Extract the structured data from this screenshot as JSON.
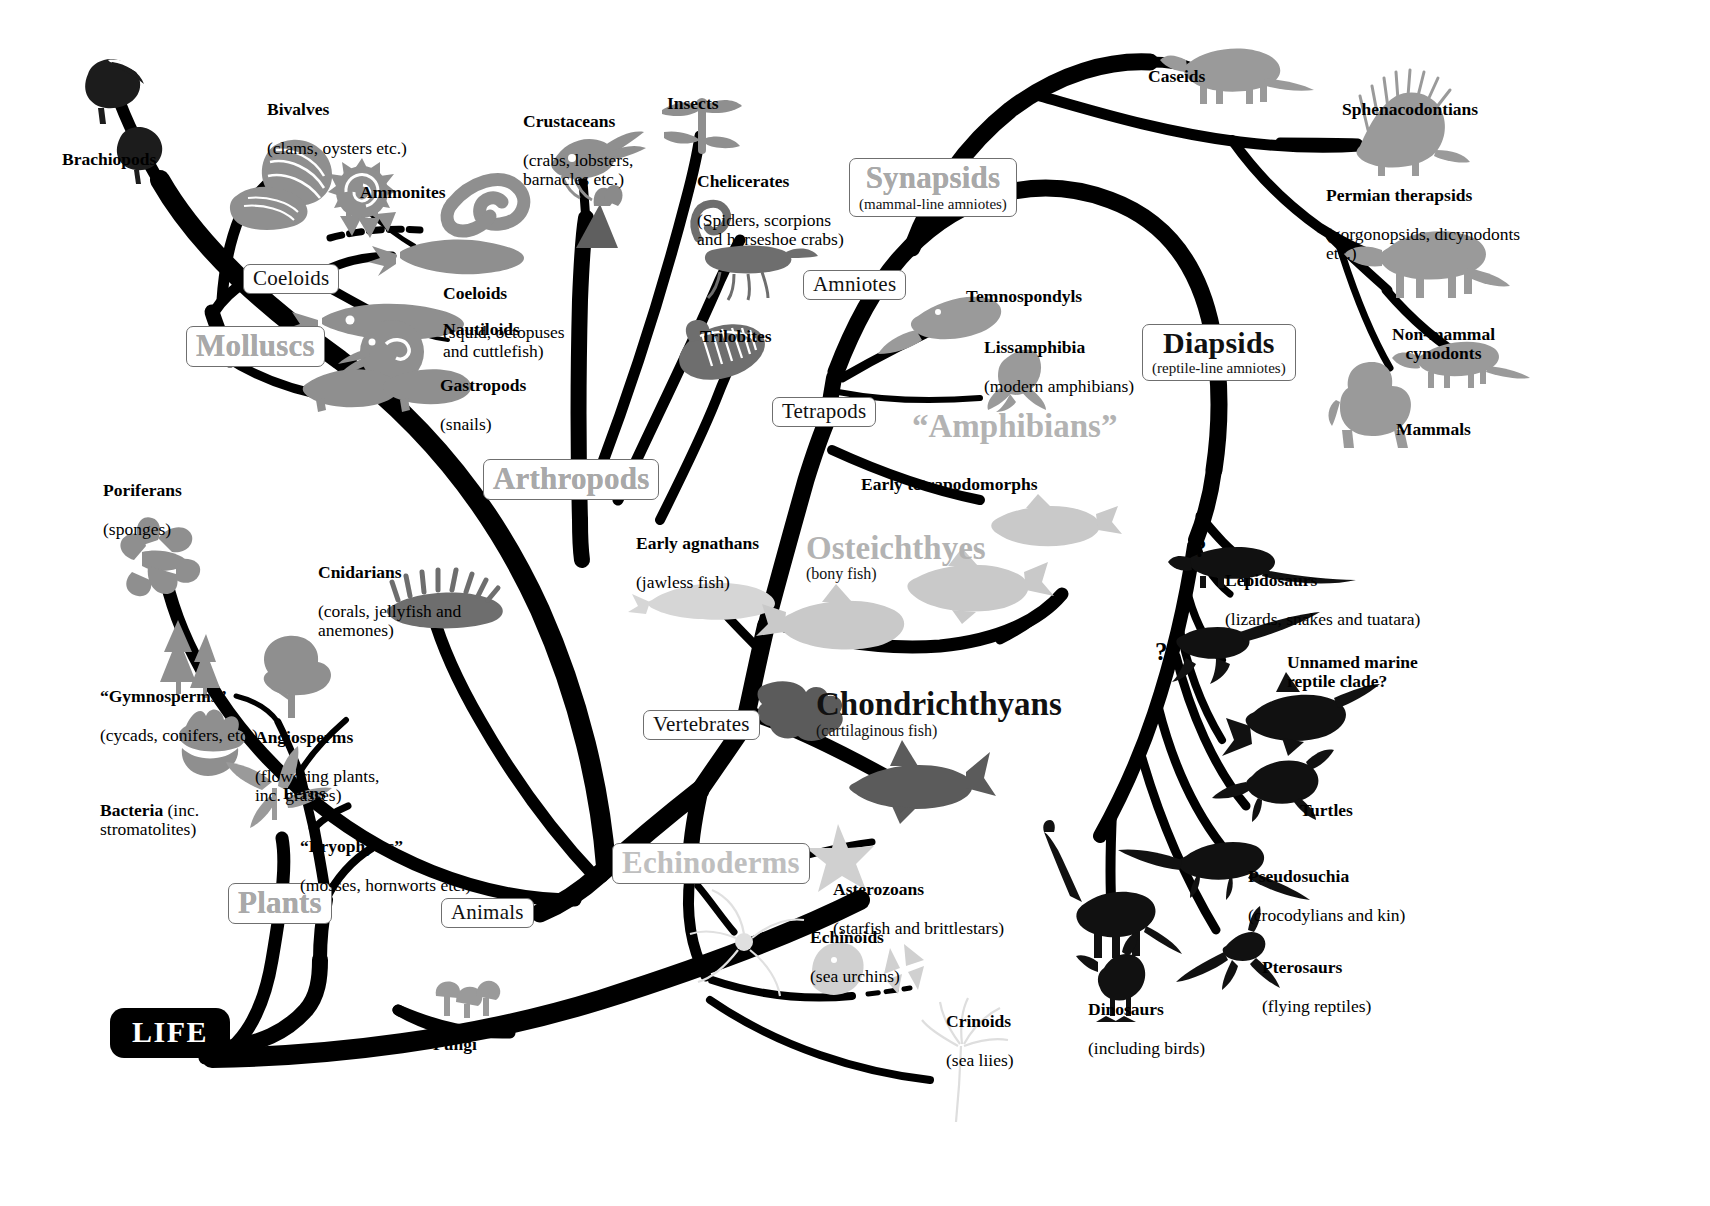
{
  "diagram": {
    "root_label": "LIFE",
    "background": "#ffffff",
    "ink": "#000000",
    "grey_clade_color": "#b3b3b3",
    "mid_grey": "#8a8a8a",
    "light_grey": "#cfcfcf"
  },
  "clade_boxes": {
    "molluscs": {
      "name": "Molluscs",
      "sub": ""
    },
    "coeloids_node": {
      "name": "Coeloids",
      "sub": ""
    },
    "arthropods": {
      "name": "Arthropods",
      "sub": ""
    },
    "synapsids": {
      "name": "Synapsids",
      "sub": "(mammal-line amniotes)"
    },
    "amniotes": {
      "name": "Amniotes",
      "sub": ""
    },
    "tetrapods": {
      "name": "Tetrapods",
      "sub": ""
    },
    "diapsids": {
      "name": "Diapsids",
      "sub": "(reptile-line amniotes)"
    },
    "vertebrates": {
      "name": "Vertebrates",
      "sub": ""
    },
    "echinoderms": {
      "name": "Echinoderms",
      "sub": ""
    },
    "plants": {
      "name": "Plants",
      "sub": ""
    },
    "animals": {
      "name": "Animals",
      "sub": ""
    }
  },
  "display_words": {
    "amphibians": {
      "name": "“Amphibians”",
      "sub": ""
    },
    "osteichthyes": {
      "name": "Osteichthyes",
      "sub": "(bony fish)"
    },
    "chondrichthyans": {
      "name": "Chondrichthyans",
      "sub": "(cartilaginous fish)"
    }
  },
  "taxa": [
    {
      "id": "brachiopods",
      "name": "Brachiopods",
      "sub": ""
    },
    {
      "id": "bivalves",
      "name": "Bivalves",
      "sub": "(clams, oysters etc.)"
    },
    {
      "id": "ammonites",
      "name": "Ammonites",
      "sub": ""
    },
    {
      "id": "coeloids",
      "name": "Coeloids",
      "sub": "(squid, octopuses\nand cuttlefish)"
    },
    {
      "id": "nautiloids",
      "name": "Nautiloids",
      "sub": ""
    },
    {
      "id": "gastropods",
      "name": "Gastropods",
      "sub": "(snails)"
    },
    {
      "id": "crustaceans",
      "name": "Crustaceans",
      "sub": "(crabs, lobsters,\nbarnacles etc.)"
    },
    {
      "id": "insects",
      "name": "Insects",
      "sub": ""
    },
    {
      "id": "chelicerates",
      "name": "Chelicerates",
      "sub": "(Spiders, scorpions\nand horseshoe crabs)"
    },
    {
      "id": "trilobites",
      "name": "Trilobites",
      "sub": ""
    },
    {
      "id": "poriferans",
      "name": "Poriferans",
      "sub": "(sponges)"
    },
    {
      "id": "cnidarians",
      "name": "Cnidarians",
      "sub": "(corals, jellyfish and\nanemones)"
    },
    {
      "id": "gymnosperms",
      "name": "“Gymnosperms”",
      "sub": "(cycads, conifers, etc.)"
    },
    {
      "id": "angiosperms",
      "name": "Angiosperms",
      "sub": "(flowering plants,\ninc. grasses)"
    },
    {
      "id": "ferns",
      "name": "Ferns",
      "sub": ""
    },
    {
      "id": "bryophytes",
      "name": "“Bryophytes”",
      "sub": "(mosses, hornworts etc.)"
    },
    {
      "id": "bacteria",
      "name": "Bacteria",
      "sub": "(inc.\nstromatolites)"
    },
    {
      "id": "fungi",
      "name": "Fungi",
      "sub": ""
    },
    {
      "id": "asterozoans",
      "name": "Asterozoans",
      "sub": "(starfish and brittlestars)"
    },
    {
      "id": "echinoids",
      "name": "Echinoids",
      "sub": "(sea urchins)"
    },
    {
      "id": "crinoids",
      "name": "Crinoids",
      "sub": "(sea liies)"
    },
    {
      "id": "early_agnathans",
      "name": "Early agnathans",
      "sub": "(jawless fish)"
    },
    {
      "id": "early_tetrapodomorphs",
      "name": "Early tetrapodomorphs",
      "sub": ""
    },
    {
      "id": "temnospondyls",
      "name": "Temnospondyls",
      "sub": ""
    },
    {
      "id": "lissamphibia",
      "name": "Lissamphibia",
      "sub": "(modern amphibians)"
    },
    {
      "id": "caseids",
      "name": "Caseids",
      "sub": ""
    },
    {
      "id": "sphenacodontians",
      "name": "Sphenacodontians",
      "sub": ""
    },
    {
      "id": "permian_therapsids",
      "name": "Permian therapsids",
      "sub": "(gorgonopsids, dicynodonts\netc.)"
    },
    {
      "id": "non_mammal_cynodonts",
      "name": "Non-mammal\ncynodonts",
      "sub": ""
    },
    {
      "id": "mammals",
      "name": "Mammals",
      "sub": ""
    },
    {
      "id": "lepidosaurs",
      "name": "Lepidosaurs",
      "sub": "(lizards, snakes and tuatara)"
    },
    {
      "id": "unnamed_marine",
      "name": "Unnamed marine\nreptile clade?",
      "sub": ""
    },
    {
      "id": "turtles",
      "name": "Turtles",
      "sub": ""
    },
    {
      "id": "pseudosuchia",
      "name": "Pseudosuchia",
      "sub": "(crocodylians and kin)"
    },
    {
      "id": "pterosaurs",
      "name": "Pterosaurs",
      "sub": "(flying reptiles)"
    },
    {
      "id": "dinosaurs",
      "name": "Dinosaurs",
      "sub": "(including birds)"
    }
  ],
  "uncertainty_marks": [
    {
      "id": "q1",
      "text": "?"
    },
    {
      "id": "q2",
      "text": "?"
    }
  ]
}
